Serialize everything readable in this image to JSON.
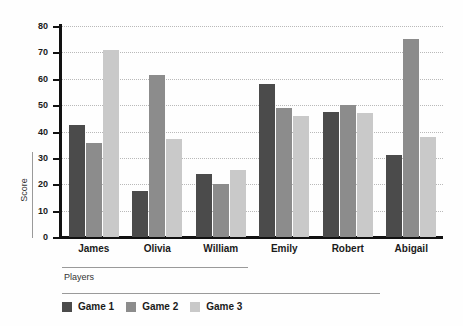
{
  "chart_data": {
    "type": "bar",
    "title": "",
    "xlabel": "Players",
    "ylabel": "Score",
    "ylim": [
      0,
      80
    ],
    "yticks": [
      0,
      10,
      20,
      30,
      40,
      50,
      60,
      70,
      80
    ],
    "ytick_labels": [
      "0",
      "10",
      "20",
      "30",
      "40",
      "50",
      "60",
      "70",
      "80"
    ],
    "grid": true,
    "legend_position": "bottom-left",
    "categories": [
      "James",
      "Olivia",
      "William",
      "Emily",
      "Robert",
      "Abigail"
    ],
    "series": [
      {
        "name": "Game 1",
        "color": "#4b4b4b",
        "values": [
          42.5,
          17.5,
          24,
          58,
          47.5,
          31
        ]
      },
      {
        "name": "Game 2",
        "color": "#8c8c8c",
        "values": [
          35.5,
          61.5,
          20,
          49,
          50,
          75
        ]
      },
      {
        "name": "Game 3",
        "color": "#c9c9c9",
        "values": [
          71,
          37,
          25.5,
          46,
          47,
          38
        ]
      }
    ]
  },
  "axes": {
    "y_title": "Score",
    "x_title": "Players"
  },
  "colors": {
    "axis": "#111111",
    "gridline": "#b9b9b9",
    "separator": "#9a9a9a",
    "background": "#fefefe",
    "text": "#1a1a1a"
  }
}
